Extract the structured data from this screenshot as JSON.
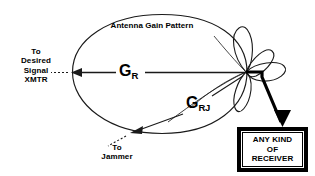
{
  "figure": {
    "title_in_lobe": "Antenna Gain Pattern",
    "background_color": "#ffffff",
    "stroke_color": "#000000"
  },
  "labels": {
    "pattern": "Antenna Gain Pattern",
    "gain_main": {
      "symbol": "G",
      "subscript": "R"
    },
    "gain_jammer": {
      "symbol": "G",
      "subscript": "RJ"
    },
    "to_desired_xmtr": [
      "To",
      "Desired",
      "Signal",
      "XMTR"
    ],
    "to_jammer": [
      "To",
      "Jammer"
    ]
  },
  "receiver_box": {
    "lines": [
      "ANY KIND",
      "OF",
      "RECEIVER"
    ],
    "border_color": "#000000",
    "fill_color": "#ffffff"
  },
  "icons": {
    "main_lobe": "antenna-main-lobe",
    "side_lobes": "antenna-side-lobes",
    "arrow_main_gain": "left-arrow",
    "arrow_jammer_gain": "down-left-arrow",
    "arrow_to_receiver": "down-arrow-thick",
    "dotted_lead_left": "dotted-line",
    "dotted_lead_jammer": "dotted-line"
  }
}
